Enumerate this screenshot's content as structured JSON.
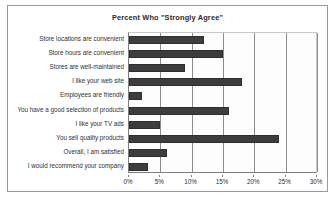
{
  "chart_data": {
    "type": "bar",
    "orientation": "horizontal",
    "title": "Percent Who \"Strongly Agree\"",
    "xlabel": "",
    "ylabel": "",
    "xlim": [
      0,
      30
    ],
    "xticks": [
      "0%",
      "5%",
      "10%",
      "15%",
      "20%",
      "25%",
      "30%"
    ],
    "xtick_values": [
      0,
      5,
      10,
      15,
      20,
      25,
      30
    ],
    "grid": "vertical",
    "legend": "none",
    "bar_color": "#3d3d3d",
    "categories": [
      "Store locations are convenient",
      "Store hours are convenient",
      "Stores are well-maintained",
      "I like your web site",
      "Employees are friendly",
      "You have a good selection of products",
      "I like your TV ads",
      "You sell quality products",
      "Overall, I am satisfied",
      "I would recommend your company"
    ],
    "values": [
      12,
      15,
      9,
      18,
      2,
      16,
      5,
      24,
      6,
      3
    ]
  }
}
